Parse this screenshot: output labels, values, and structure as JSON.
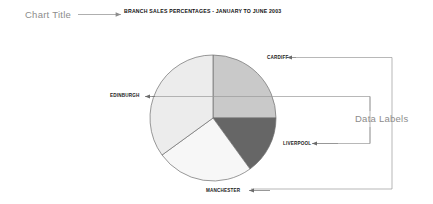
{
  "annotations": {
    "chart_title_callout": "Chart Title",
    "data_labels_callout": "Data Labels"
  },
  "chart_title": "BRANCH SALES PERCENTAGES - JANUARY TO JUNE 2003",
  "colors": {
    "annotation_text": "#8c8c8c",
    "leader_line": "#9a9a9a",
    "chart_title_text": "#111111",
    "pie_label_text": "#1a1a1a",
    "pie_outline": "#6e6e6e",
    "background": "#ffffff",
    "cardiff": "#c9c9c9",
    "liverpool": "#666666",
    "manchester": "#f7f7f7",
    "edinburgh": "#ececec"
  },
  "chart_data": {
    "type": "pie",
    "title": "BRANCH SALES PERCENTAGES - JANUARY TO JUNE 2003",
    "xlabel": "",
    "ylabel": "",
    "legend_position": "none",
    "grid": false,
    "labels_shown_as": "data labels with leader arrows",
    "categories": [
      "CARDIFF",
      "LIVERPOOL",
      "MANCHESTER",
      "EDINBURGH"
    ],
    "values": [
      25,
      15,
      25,
      35
    ],
    "units": "percent",
    "start_angle_deg": 0,
    "direction": "clockwise",
    "slices": [
      {
        "label": "CARDIFF",
        "value": 25,
        "color": "#c9c9c9",
        "start_deg": 0,
        "end_deg": 90
      },
      {
        "label": "LIVERPOOL",
        "value": 15,
        "color": "#666666",
        "start_deg": 90,
        "end_deg": 144
      },
      {
        "label": "MANCHESTER",
        "value": 25,
        "color": "#f7f7f7",
        "start_deg": 144,
        "end_deg": 234
      },
      {
        "label": "EDINBURGH",
        "value": 35,
        "color": "#ececec",
        "start_deg": 234,
        "end_deg": 360
      }
    ]
  },
  "pie_geometry": {
    "center_x": 213,
    "center_y": 118,
    "radius": 63
  }
}
